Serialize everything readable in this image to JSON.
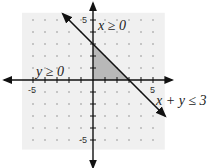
{
  "chart_data": {
    "type": "area",
    "title": "",
    "xlabel": "",
    "ylabel": "",
    "xlim": [
      -6,
      6
    ],
    "ylim": [
      -6,
      6
    ],
    "grid": "dots",
    "tick_labels": {
      "x": [
        {
          "value": -5,
          "label": "-5"
        },
        {
          "value": 5,
          "label": "5"
        }
      ],
      "y": [
        {
          "value": 5,
          "label": "5"
        },
        {
          "value": -5,
          "label": "-5"
        }
      ]
    },
    "boundary_line": {
      "equation": "x + y = 3",
      "label": "x + y ≤ 3",
      "x_range": [
        -2.5,
        6
      ]
    },
    "feasible_region": {
      "vertices": [
        [
          0,
          0
        ],
        [
          0,
          3
        ],
        [
          3,
          0
        ]
      ],
      "color": "#b8b8b8"
    },
    "background_shading": "#f0f0f0",
    "annotations": [
      {
        "text": "x ≥ 0",
        "at": [
          0.4,
          4.6
        ]
      },
      {
        "text": "y ≥ 0",
        "at": [
          -4.5,
          0.3
        ]
      },
      {
        "text": "x + y ≤ 3",
        "at": [
          5.1,
          -1.6
        ]
      }
    ]
  }
}
